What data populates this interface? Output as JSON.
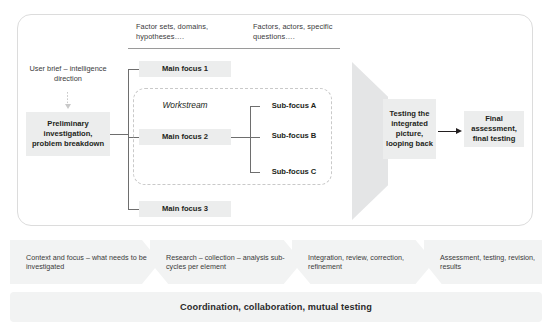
{
  "diagram": {
    "colors": {
      "node_fill": "#eceded",
      "band_fill": "#f2f3f3",
      "funnel_fill": "#e4e5e6",
      "line": "#6e6e6e",
      "frame_border": "#dcdcdc",
      "text": "#231f20"
    },
    "header": {
      "column_1": "Factor sets, domains, hypotheses….",
      "column_2": "Factors, actors, specific questions…."
    },
    "left_column": {
      "input_label": "User brief – intelligence direction",
      "arrow_icon": "arrow-down-icon",
      "stage_label": "Preliminary investigation, problem breakdown"
    },
    "main_focuses": [
      {
        "label": "Main focus 1"
      },
      {
        "label": "Main focus 2"
      },
      {
        "label": "Main focus 3"
      }
    ],
    "workstream": {
      "label": "Workstream",
      "sub_focuses": [
        {
          "label": "Sub-focus A"
        },
        {
          "label": "Sub-focus B"
        },
        {
          "label": "Sub-focus C"
        }
      ]
    },
    "funnel": {
      "icon": "funnel-shape",
      "label": "Testing the integrated picture, looping back"
    },
    "final": {
      "arrow_icon": "arrow-right-icon",
      "label": "Final assessment, final testing"
    },
    "phase_band": {
      "icon": "chevron-right-icon",
      "phases": [
        {
          "label": "Context and focus – what needs to be investigated"
        },
        {
          "label": "Research – collection – analysis sub-cycles per element"
        },
        {
          "label": "Integration, review, correction, refinement"
        },
        {
          "label": "Assessment, testing, revision, results"
        }
      ]
    },
    "coordination_band": {
      "label": "Coordination, collaboration, mutual testing"
    }
  }
}
